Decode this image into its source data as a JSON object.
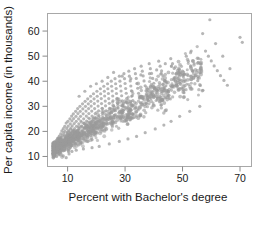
{
  "figure": {
    "background_color": "#ffffff",
    "frame_color": "#a8a8a8",
    "point_color": "#9a9a9a",
    "text_color": "#1a1a1a"
  },
  "chart_data": {
    "type": "scatter",
    "title": "",
    "xlabel": "Percent with Bachelor's degree",
    "ylabel": "Per capita income (in thousands)",
    "xlim": [
      3,
      74
    ],
    "ylim": [
      6,
      67
    ],
    "xticks": [
      10,
      30,
      50,
      70
    ],
    "xtick_labels": [
      "10",
      "30",
      "50",
      "70"
    ],
    "yticks": [
      10,
      20,
      30,
      40,
      50,
      60
    ],
    "ytick_labels": [
      "10",
      "20",
      "30",
      "40",
      "50",
      "60"
    ],
    "grid": false,
    "legend": false,
    "marker": "circle",
    "marker_color": "#9a9a9a",
    "marker_size": 1.6,
    "n_points": 1400,
    "correlation": 0.75,
    "points": [
      [
        4.8,
        14.2
      ],
      [
        5.2,
        13.1
      ],
      [
        5.5,
        15.8
      ],
      [
        5.9,
        12.6
      ],
      [
        6.1,
        16.4
      ],
      [
        6.3,
        14.9
      ],
      [
        6.5,
        17.2
      ],
      [
        6.7,
        13.8
      ],
      [
        6.9,
        15.5
      ],
      [
        7.1,
        18.1
      ],
      [
        7.2,
        16.7
      ],
      [
        7.4,
        14.3
      ],
      [
        7.6,
        19.0
      ],
      [
        7.8,
        17.5
      ],
      [
        7.9,
        15.1
      ],
      [
        8.0,
        20.2
      ],
      [
        8.2,
        18.3
      ],
      [
        8.3,
        16.2
      ],
      [
        8.5,
        21.1
      ],
      [
        8.6,
        19.4
      ],
      [
        8.8,
        17.1
      ],
      [
        8.9,
        14.8
      ],
      [
        9.0,
        22.0
      ],
      [
        9.1,
        20.1
      ],
      [
        9.3,
        18.0
      ],
      [
        9.4,
        16.1
      ],
      [
        9.5,
        23.3
      ],
      [
        9.7,
        21.2
      ],
      [
        9.8,
        19.2
      ],
      [
        9.9,
        17.3
      ],
      [
        10.0,
        15.4
      ],
      [
        10.1,
        24.0
      ],
      [
        10.2,
        22.1
      ],
      [
        10.4,
        20.3
      ],
      [
        10.5,
        18.4
      ],
      [
        10.6,
        16.6
      ],
      [
        10.8,
        25.0
      ],
      [
        10.9,
        23.0
      ],
      [
        11.0,
        21.0
      ],
      [
        11.1,
        19.1
      ],
      [
        11.3,
        17.2
      ],
      [
        11.4,
        26.1
      ],
      [
        11.5,
        24.2
      ],
      [
        11.6,
        22.2
      ],
      [
        11.8,
        20.2
      ],
      [
        11.9,
        18.3
      ],
      [
        12.0,
        27.0
      ],
      [
        12.1,
        25.1
      ],
      [
        12.3,
        23.1
      ],
      [
        12.4,
        21.1
      ],
      [
        12.5,
        19.2
      ],
      [
        12.6,
        17.4
      ],
      [
        12.8,
        28.0
      ],
      [
        12.9,
        26.0
      ],
      [
        13.0,
        24.0
      ],
      [
        13.1,
        22.0
      ],
      [
        13.3,
        20.1
      ],
      [
        13.4,
        18.2
      ],
      [
        13.5,
        29.1
      ],
      [
        13.6,
        27.1
      ],
      [
        13.8,
        25.0
      ],
      [
        13.9,
        23.0
      ],
      [
        14.0,
        21.1
      ],
      [
        14.1,
        19.2
      ],
      [
        14.3,
        30.0
      ],
      [
        14.4,
        28.0
      ],
      [
        14.5,
        26.0
      ],
      [
        14.6,
        24.1
      ],
      [
        14.8,
        22.1
      ],
      [
        14.9,
        20.2
      ],
      [
        15.0,
        18.4
      ],
      [
        15.2,
        31.0
      ],
      [
        15.3,
        29.0
      ],
      [
        15.4,
        27.0
      ],
      [
        15.6,
        25.0
      ],
      [
        15.7,
        23.1
      ],
      [
        15.8,
        21.2
      ],
      [
        16.0,
        19.3
      ],
      [
        16.1,
        32.0
      ],
      [
        16.2,
        30.0
      ],
      [
        16.4,
        28.1
      ],
      [
        16.5,
        26.1
      ],
      [
        16.6,
        24.1
      ],
      [
        16.8,
        22.2
      ],
      [
        16.9,
        20.3
      ],
      [
        17.0,
        33.0
      ],
      [
        17.2,
        31.0
      ],
      [
        17.3,
        29.1
      ],
      [
        17.4,
        27.1
      ],
      [
        17.6,
        25.1
      ],
      [
        17.7,
        23.2
      ],
      [
        17.8,
        21.3
      ],
      [
        18.0,
        34.0
      ],
      [
        18.1,
        32.0
      ],
      [
        18.2,
        30.1
      ],
      [
        18.4,
        28.1
      ],
      [
        18.5,
        26.1
      ],
      [
        18.6,
        24.2
      ],
      [
        18.8,
        22.3
      ],
      [
        18.9,
        20.4
      ],
      [
        19.0,
        35.0
      ],
      [
        19.2,
        33.0
      ],
      [
        19.3,
        31.1
      ],
      [
        19.4,
        29.1
      ],
      [
        19.6,
        27.1
      ],
      [
        19.7,
        25.2
      ],
      [
        19.8,
        23.3
      ],
      [
        20.0,
        21.4
      ],
      [
        20.2,
        36.0
      ],
      [
        20.3,
        34.0
      ],
      [
        20.5,
        32.1
      ],
      [
        20.6,
        30.1
      ],
      [
        20.8,
        28.2
      ],
      [
        20.9,
        26.2
      ],
      [
        21.0,
        24.3
      ],
      [
        21.2,
        22.4
      ],
      [
        21.4,
        37.0
      ],
      [
        21.5,
        35.0
      ],
      [
        21.7,
        33.1
      ],
      [
        21.8,
        31.1
      ],
      [
        22.0,
        29.2
      ],
      [
        22.1,
        27.2
      ],
      [
        22.3,
        25.3
      ],
      [
        22.4,
        23.4
      ],
      [
        22.6,
        38.0
      ],
      [
        22.8,
        36.0
      ],
      [
        22.9,
        34.1
      ],
      [
        23.1,
        32.1
      ],
      [
        23.2,
        30.2
      ],
      [
        23.4,
        28.2
      ],
      [
        23.5,
        26.3
      ],
      [
        23.7,
        24.4
      ],
      [
        23.9,
        39.0
      ],
      [
        24.0,
        37.0
      ],
      [
        24.2,
        35.1
      ],
      [
        24.3,
        33.1
      ],
      [
        24.5,
        31.2
      ],
      [
        24.6,
        29.2
      ],
      [
        24.8,
        27.3
      ],
      [
        25.0,
        25.4
      ],
      [
        25.2,
        40.0
      ],
      [
        25.3,
        38.0
      ],
      [
        25.5,
        36.1
      ],
      [
        25.7,
        34.1
      ],
      [
        25.8,
        32.2
      ],
      [
        26.0,
        30.2
      ],
      [
        26.2,
        28.3
      ],
      [
        26.3,
        26.4
      ],
      [
        26.5,
        41.0
      ],
      [
        26.7,
        39.0
      ],
      [
        26.9,
        37.1
      ],
      [
        27.0,
        35.1
      ],
      [
        27.2,
        33.2
      ],
      [
        27.4,
        31.2
      ],
      [
        27.6,
        29.3
      ],
      [
        27.8,
        27.4
      ],
      [
        28.0,
        42.0
      ],
      [
        28.2,
        40.0
      ],
      [
        28.4,
        38.1
      ],
      [
        28.6,
        36.1
      ],
      [
        28.8,
        34.2
      ],
      [
        29.0,
        32.2
      ],
      [
        29.2,
        30.3
      ],
      [
        29.4,
        28.4
      ],
      [
        29.6,
        43.0
      ],
      [
        29.8,
        41.0
      ],
      [
        30.0,
        39.1
      ],
      [
        30.2,
        37.1
      ],
      [
        30.4,
        35.2
      ],
      [
        30.6,
        33.2
      ],
      [
        30.8,
        31.3
      ],
      [
        31.0,
        29.4
      ],
      [
        31.3,
        44.0
      ],
      [
        31.5,
        42.0
      ],
      [
        31.8,
        40.1
      ],
      [
        32.0,
        38.1
      ],
      [
        32.2,
        36.2
      ],
      [
        32.5,
        34.2
      ],
      [
        32.7,
        32.3
      ],
      [
        33.0,
        30.4
      ],
      [
        33.3,
        45.0
      ],
      [
        33.6,
        43.0
      ],
      [
        33.9,
        41.1
      ],
      [
        34.1,
        39.1
      ],
      [
        34.4,
        37.2
      ],
      [
        34.7,
        35.2
      ],
      [
        35.0,
        33.3
      ],
      [
        35.3,
        31.4
      ],
      [
        35.6,
        46.0
      ],
      [
        36.0,
        44.0
      ],
      [
        36.3,
        42.1
      ],
      [
        36.6,
        40.1
      ],
      [
        37.0,
        38.2
      ],
      [
        37.3,
        36.2
      ],
      [
        37.7,
        34.3
      ],
      [
        38.0,
        32.4
      ],
      [
        38.4,
        47.0
      ],
      [
        38.8,
        45.0
      ],
      [
        39.2,
        43.1
      ],
      [
        39.6,
        41.1
      ],
      [
        40.0,
        39.2
      ],
      [
        40.4,
        37.2
      ],
      [
        40.8,
        35.3
      ],
      [
        41.2,
        33.4
      ],
      [
        41.7,
        48.0
      ],
      [
        42.2,
        46.0
      ],
      [
        42.7,
        44.1
      ],
      [
        43.2,
        42.1
      ],
      [
        43.7,
        40.2
      ],
      [
        44.2,
        38.2
      ],
      [
        44.8,
        36.3
      ],
      [
        45.3,
        34.4
      ],
      [
        45.9,
        49.0
      ],
      [
        46.5,
        47.0
      ],
      [
        47.1,
        45.1
      ],
      [
        47.8,
        43.1
      ],
      [
        48.4,
        41.2
      ],
      [
        49.1,
        39.2
      ],
      [
        49.8,
        37.3
      ],
      [
        50.5,
        35.4
      ],
      [
        51.3,
        50.0
      ],
      [
        52.0,
        48.0
      ],
      [
        52.8,
        46.1
      ],
      [
        53.6,
        44.1
      ],
      [
        54.4,
        42.2
      ],
      [
        55.3,
        40.2
      ],
      [
        56.2,
        38.3
      ],
      [
        57.1,
        36.4
      ],
      [
        58.0,
        52.0
      ],
      [
        59.0,
        50.0
      ],
      [
        60.0,
        48.1
      ],
      [
        61.0,
        46.1
      ],
      [
        62.1,
        44.2
      ],
      [
        63.2,
        42.2
      ],
      [
        64.4,
        40.3
      ],
      [
        65.6,
        38.4
      ],
      [
        59.5,
        64.5
      ],
      [
        57.0,
        59.0
      ],
      [
        61.5,
        55.0
      ],
      [
        70.0,
        57.5
      ],
      [
        70.8,
        55.5
      ],
      [
        64.0,
        50.0
      ],
      [
        66.5,
        45.0
      ],
      [
        55.5,
        47.5
      ],
      [
        53.0,
        52.0
      ],
      [
        50.0,
        44.0
      ],
      [
        47.0,
        41.0
      ],
      [
        44.0,
        47.0
      ],
      [
        41.0,
        44.5
      ],
      [
        38.5,
        43.0
      ],
      [
        35.5,
        42.5
      ],
      [
        32.0,
        41.0
      ],
      [
        29.0,
        42.0
      ],
      [
        26.0,
        43.5
      ],
      [
        24.0,
        41.5
      ],
      [
        22.0,
        40.0
      ],
      [
        20.0,
        39.0
      ],
      [
        18.0,
        38.0
      ],
      [
        16.0,
        36.0
      ],
      [
        14.0,
        34.0
      ],
      [
        8.5,
        10.2
      ],
      [
        9.5,
        9.5
      ],
      [
        10.5,
        11.0
      ],
      [
        7.5,
        11.8
      ],
      [
        11.5,
        12.0
      ],
      [
        13.0,
        12.5
      ],
      [
        15.5,
        13.0
      ],
      [
        18.5,
        13.5
      ],
      [
        21.0,
        14.0
      ],
      [
        24.5,
        15.0
      ],
      [
        28.0,
        16.0
      ],
      [
        31.0,
        17.0
      ],
      [
        34.0,
        18.0
      ],
      [
        37.0,
        19.5
      ],
      [
        40.5,
        21.0
      ],
      [
        43.5,
        22.5
      ],
      [
        46.0,
        24.0
      ],
      [
        49.0,
        26.0
      ],
      [
        52.5,
        28.0
      ],
      [
        56.0,
        30.0
      ]
    ]
  }
}
